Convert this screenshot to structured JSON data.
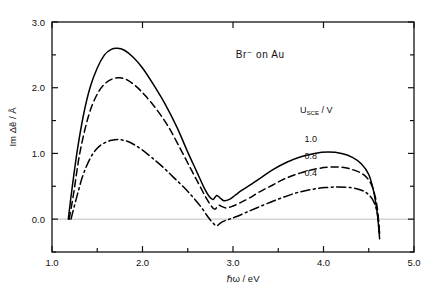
{
  "chart_data": {
    "type": "line",
    "title": "Br⁻ on Au",
    "xlabel": "ℏω / eV",
    "ylabel": "Im Δẽ / Å",
    "xlim": [
      1.0,
      5.0
    ],
    "ylim": [
      -0.5,
      3.0
    ],
    "xticks": [
      1.0,
      2.0,
      3.0,
      4.0,
      5.0
    ],
    "xticklabels": [
      "1.0",
      "2.0",
      "3.0",
      "4.0",
      "5.0"
    ],
    "xminorticks": [
      1.5,
      2.5,
      3.5,
      4.5
    ],
    "yticks": [
      0.0,
      1.0,
      2.0,
      3.0
    ],
    "yticklabels": [
      "0.0",
      "1.0",
      "2.0",
      "3.0"
    ],
    "yminorticks": [
      -0.5,
      0.5,
      1.5,
      2.5
    ],
    "grid": false,
    "zero_line": true,
    "legend_title": "U",
    "legend_title_sub": "SCE",
    "legend_title_unit": "/ V",
    "legend_position": "inside-right",
    "series": [
      {
        "name": "1.0",
        "style": "solid",
        "color": "#000000",
        "x": [
          1.18,
          1.22,
          1.28,
          1.35,
          1.42,
          1.5,
          1.58,
          1.65,
          1.72,
          1.8,
          1.9,
          2.0,
          2.12,
          2.25,
          2.38,
          2.5,
          2.6,
          2.68,
          2.74,
          2.78,
          2.82,
          2.86,
          2.9,
          2.96,
          3.02,
          3.1,
          3.2,
          3.32,
          3.45,
          3.6,
          3.75,
          3.9,
          4.05,
          4.2,
          4.32,
          4.42,
          4.5,
          4.55,
          4.58,
          4.6,
          4.62
        ],
        "y": [
          0.0,
          0.45,
          1.05,
          1.6,
          2.0,
          2.3,
          2.5,
          2.58,
          2.6,
          2.57,
          2.46,
          2.3,
          2.05,
          1.75,
          1.4,
          1.02,
          0.72,
          0.48,
          0.34,
          0.3,
          0.36,
          0.32,
          0.28,
          0.3,
          0.36,
          0.44,
          0.53,
          0.64,
          0.76,
          0.87,
          0.95,
          1.0,
          1.02,
          1.0,
          0.94,
          0.84,
          0.68,
          0.45,
          0.22,
          0.02,
          -0.3
        ]
      },
      {
        "name": "0.8",
        "style": "dashed",
        "color": "#000000",
        "x": [
          1.19,
          1.24,
          1.3,
          1.37,
          1.44,
          1.52,
          1.6,
          1.68,
          1.75,
          1.83,
          1.93,
          2.03,
          2.15,
          2.28,
          2.4,
          2.52,
          2.62,
          2.7,
          2.76,
          2.8,
          2.84,
          2.88,
          2.93,
          3.0,
          3.08,
          3.18,
          3.3,
          3.44,
          3.58,
          3.74,
          3.9,
          4.05,
          4.2,
          4.33,
          4.44,
          4.52,
          4.57,
          4.6,
          4.62
        ],
        "y": [
          0.0,
          0.4,
          0.95,
          1.4,
          1.72,
          1.95,
          2.08,
          2.14,
          2.15,
          2.12,
          2.02,
          1.88,
          1.68,
          1.42,
          1.12,
          0.8,
          0.54,
          0.33,
          0.2,
          0.15,
          0.21,
          0.19,
          0.17,
          0.2,
          0.25,
          0.32,
          0.42,
          0.52,
          0.62,
          0.7,
          0.76,
          0.79,
          0.79,
          0.75,
          0.68,
          0.55,
          0.35,
          0.1,
          -0.25
        ]
      },
      {
        "name": "0.4",
        "style": "dashdot",
        "color": "#000000",
        "x": [
          1.21,
          1.27,
          1.34,
          1.42,
          1.5,
          1.58,
          1.66,
          1.74,
          1.82,
          1.9,
          2.0,
          2.1,
          2.22,
          2.34,
          2.46,
          2.56,
          2.65,
          2.72,
          2.78,
          2.82,
          2.86,
          2.9,
          2.96,
          3.04,
          3.14,
          3.26,
          3.4,
          3.55,
          3.7,
          3.86,
          4.02,
          4.16,
          4.3,
          4.42,
          4.5,
          4.56,
          4.6,
          4.62
        ],
        "y": [
          0.0,
          0.32,
          0.66,
          0.92,
          1.08,
          1.16,
          1.2,
          1.21,
          1.19,
          1.14,
          1.05,
          0.94,
          0.8,
          0.64,
          0.48,
          0.33,
          0.18,
          0.04,
          -0.06,
          -0.1,
          -0.06,
          -0.03,
          0.0,
          0.04,
          0.1,
          0.17,
          0.25,
          0.33,
          0.4,
          0.45,
          0.48,
          0.49,
          0.48,
          0.44,
          0.37,
          0.25,
          0.05,
          -0.22
        ]
      }
    ],
    "annotations": [
      {
        "name": "sample-label",
        "text": "Br⁻ on Au",
        "x": 3.3,
        "y": 2.45
      }
    ]
  }
}
